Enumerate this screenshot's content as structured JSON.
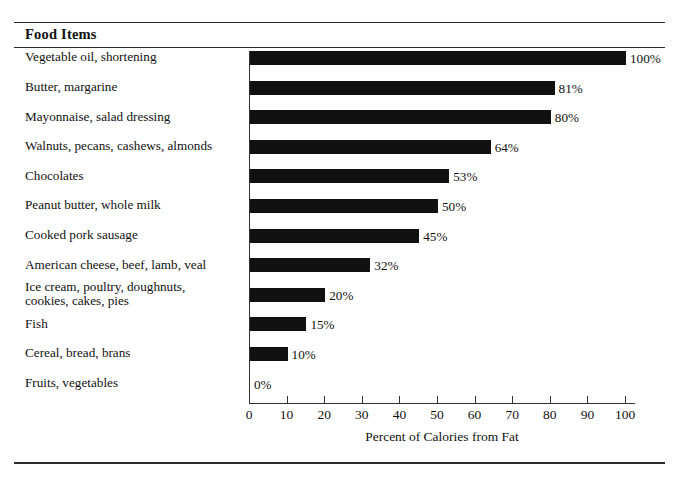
{
  "header": {
    "title": "Food Items"
  },
  "chart_data": {
    "type": "bar",
    "orientation": "horizontal",
    "title": "Food Items",
    "xlabel": "Percent of Calories from Fat",
    "ylabel": "",
    "xlim": [
      0,
      100
    ],
    "xticks": [
      0,
      10,
      20,
      30,
      40,
      50,
      60,
      70,
      80,
      90,
      100
    ],
    "xtick_labels": [
      "0",
      "10",
      "20",
      "30",
      "40",
      "50",
      "60",
      "70",
      "80",
      "90",
      "100"
    ],
    "grid": false,
    "legend": null,
    "bar_color": "#111111",
    "categories": [
      "Vegetable oil, shortening",
      "Butter, margarine",
      "Mayonnaise, salad dressing",
      "Walnuts, pecans, cashews, almonds",
      "Chocolates",
      "Peanut butter, whole milk",
      "Cooked pork sausage",
      "American cheese, beef, lamb, veal",
      "Ice cream, poultry, doughnuts,\ncookies, cakes, pies",
      "Fish",
      "Cereal, bread, brans",
      "Fruits, vegetables"
    ],
    "values": [
      100,
      81,
      80,
      64,
      53,
      50,
      45,
      32,
      20,
      15,
      10,
      0
    ],
    "data_labels": [
      "100%",
      "81%",
      "80%",
      "64%",
      "53%",
      "50%",
      "45%",
      "32%",
      "20%",
      "15%",
      "10%",
      "0%"
    ]
  }
}
